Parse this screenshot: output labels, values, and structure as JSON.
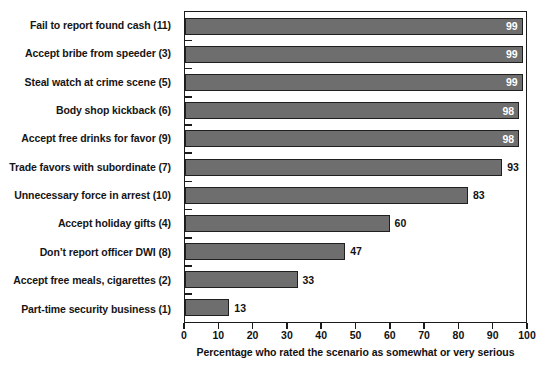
{
  "chart_data": {
    "type": "bar",
    "orientation": "horizontal",
    "title": "",
    "xlabel": "Percentage who rated the scenario as somewhat or very serious",
    "ylabel": "",
    "xlim": [
      0,
      100
    ],
    "xticks": [
      0,
      10,
      20,
      30,
      40,
      50,
      60,
      70,
      80,
      90,
      100
    ],
    "grid": false,
    "legend": false,
    "bar_color": "#6e6e6e",
    "bar_edge_color": "#1f1f1f",
    "inside_label_color": "#ffffff",
    "outside_label_color": "#111111",
    "categories": [
      "Fail to report found cash (11)",
      "Accept bribe from speeder (3)",
      "Steal watch at crime scene (5)",
      "Body shop kickback (6)",
      "Accept free drinks for favor (9)",
      "Trade favors with subordinate (7)",
      "Unnecessary force in arrest (10)",
      "Accept holiday gifts (4)",
      "Don’t report officer DWI (8)",
      "Accept free meals, cigarettes (2)",
      "Part-time security business (1)"
    ],
    "values": [
      99,
      99,
      99,
      98,
      98,
      93,
      83,
      60,
      47,
      33,
      13
    ],
    "value_labels": [
      "99",
      "99",
      "99",
      "98",
      "98",
      "93",
      "83",
      "60",
      "47",
      "33",
      "13"
    ],
    "label_placement": [
      "inside",
      "inside",
      "inside",
      "inside",
      "inside",
      "outside",
      "outside",
      "outside",
      "outside",
      "outside",
      "outside"
    ]
  }
}
